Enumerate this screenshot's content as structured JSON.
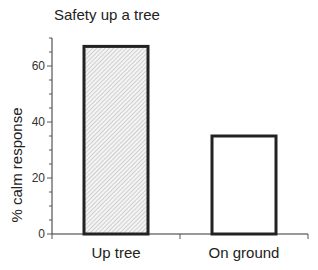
{
  "chart_data": {
    "type": "bar",
    "title": "Safety up a tree",
    "xlabel": "",
    "ylabel": "% calm response",
    "categories": [
      "Up tree",
      "On ground"
    ],
    "values": [
      67,
      35
    ],
    "ylim": [
      0,
      70
    ],
    "yticks": [
      0,
      20,
      40,
      60
    ],
    "yticks_minor_step": 5,
    "grid": false,
    "legend": null,
    "bar_styles": [
      {
        "fill": "hatched",
        "hatch_color": "#bbbbbb",
        "edge_color": "#222222"
      },
      {
        "fill": "#ffffff",
        "edge_color": "#222222"
      }
    ]
  },
  "labels": {
    "title": "Safety up a tree",
    "ylabel": "% calm response",
    "yticks": [
      "0",
      "20",
      "40",
      "60"
    ],
    "categories": [
      "Up tree",
      "On ground"
    ]
  }
}
